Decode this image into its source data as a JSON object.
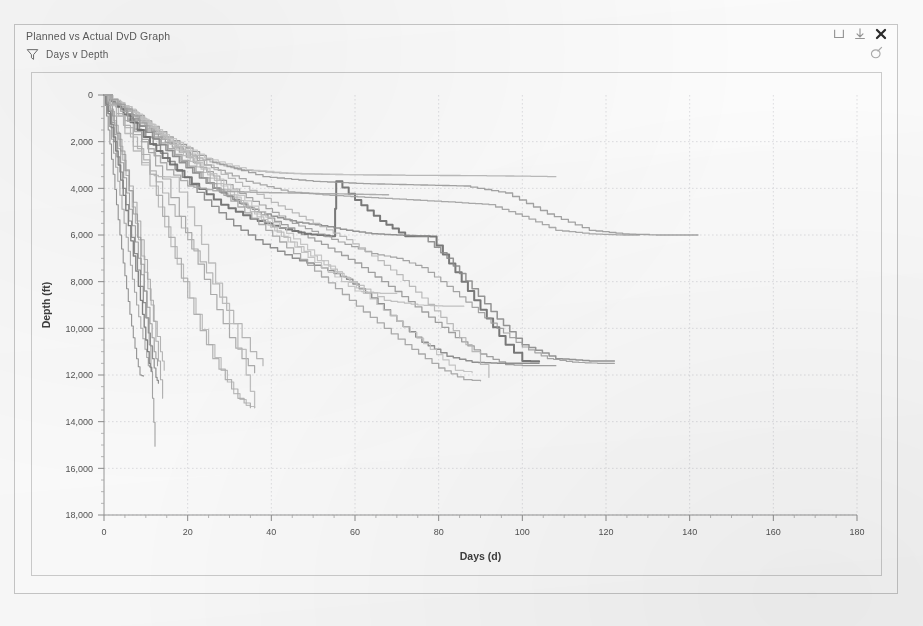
{
  "window": {
    "title": "Planned vs Actual DvD Graph",
    "subtitle": "Days v Depth",
    "funnel_icon": "filter-funnel-icon",
    "minimize_label": "minimize-icon",
    "download_label": "download-icon",
    "close_label": "close-icon",
    "edit_label": "edit-pencil-icon",
    "frame_color": "#c9c9c9"
  },
  "chart_data": {
    "type": "line",
    "title": "Planned vs Actual DvD Graph",
    "subtitle": "Days v Depth",
    "xlabel": "Days (d)",
    "ylabel": "Depth (ft)",
    "xlim": [
      0,
      180
    ],
    "ylim": [
      0,
      18000
    ],
    "y_inverted": true,
    "xticks": [
      0,
      20,
      40,
      60,
      80,
      100,
      120,
      140,
      160,
      180
    ],
    "xtick_labels": [
      "0",
      "20",
      "40",
      "60",
      "80",
      "100",
      "120",
      "140",
      "160",
      "180"
    ],
    "x_minor_step": 5,
    "yticks": [
      0,
      2000,
      4000,
      6000,
      8000,
      10000,
      12000,
      14000,
      16000,
      18000
    ],
    "ytick_labels": [
      "0",
      "2,000",
      "4,000",
      "6,000",
      "8,000",
      "10,000",
      "12,000",
      "14,000",
      "16,000",
      "18,000"
    ],
    "y_minor_step": 500,
    "grid": true,
    "grid_color": "#d9d9dd",
    "legend": "none",
    "step_style": "stepped",
    "series": [
      {
        "name": "Plan A",
        "color": "#8e8e8e",
        "width": 1.1,
        "x": [
          0,
          0.6,
          1.4,
          2.2,
          3.0,
          3.8,
          4.6,
          5.4,
          6.2,
          7.0,
          7.8,
          8.6,
          9.4
        ],
        "values": [
          0,
          900,
          2100,
          3400,
          4700,
          6000,
          7200,
          8300,
          9400,
          10400,
          11300,
          12000,
          12050
        ]
      },
      {
        "name": "Plan B",
        "color": "#a5a5a5",
        "width": 1.1,
        "x": [
          0,
          0.8,
          1.8,
          2.8,
          3.8,
          4.8,
          5.8,
          6.8,
          7.8,
          8.8,
          9.8,
          10.6,
          11.2
        ],
        "values": [
          0,
          800,
          1900,
          3100,
          4300,
          5500,
          6700,
          7900,
          9000,
          10000,
          10900,
          11600,
          11700
        ]
      },
      {
        "name": "Plan C",
        "color": "#777777",
        "width": 1.3,
        "x": [
          0,
          1.0,
          2.2,
          3.4,
          4.6,
          5.8,
          7.0,
          8.2,
          9.2,
          10.0,
          10.8,
          11.4
        ],
        "values": [
          0,
          700,
          1800,
          3000,
          4300,
          5600,
          6900,
          8200,
          9400,
          10500,
          11500,
          11850
        ]
      },
      {
        "name": "Plan D",
        "color": "#9b9b9b",
        "width": 1.1,
        "x": [
          0,
          1.2,
          2.6,
          4.0,
          5.4,
          6.8,
          8.2,
          9.6,
          11.0,
          12.0,
          12.8
        ],
        "values": [
          0,
          650,
          1700,
          2900,
          4200,
          5600,
          7000,
          8400,
          9800,
          11000,
          11600
        ]
      },
      {
        "name": "Plan E",
        "color": "#b3b3b3",
        "width": 1.1,
        "x": [
          0,
          1.5,
          3.0,
          4.5,
          6.0,
          7.5,
          9.0,
          10.5,
          12.0,
          13.5,
          14.4
        ],
        "values": [
          0,
          600,
          1600,
          2800,
          4100,
          5500,
          6900,
          8300,
          9700,
          11000,
          11800
        ]
      },
      {
        "name": "Plan F",
        "color": "#8a8a8a",
        "width": 1.2,
        "x": [
          0,
          1.0,
          2.4,
          3.8,
          5.2,
          6.6,
          8.0,
          9.4,
          10.6,
          11.6,
          12.4,
          13.0
        ],
        "values": [
          0,
          800,
          2000,
          3300,
          4700,
          6100,
          7500,
          8900,
          10200,
          11300,
          12100,
          12350
        ]
      },
      {
        "name": "Plan G steep",
        "color": "#adadad",
        "width": 1.1,
        "x": [
          0,
          1.6,
          3.4,
          5.2,
          7.0,
          8.8,
          10.4,
          11.8,
          13.0,
          14.0
        ],
        "values": [
          0,
          700,
          1900,
          3200,
          4600,
          6200,
          7900,
          9700,
          11400,
          13000
        ]
      },
      {
        "name": "Plan H deep",
        "color": "#9e9e9e",
        "width": 1.1,
        "x": [
          0,
          2.0,
          4.0,
          6.0,
          8.0,
          9.6,
          10.8,
          11.6,
          12.2
        ],
        "values": [
          0,
          900,
          2400,
          4100,
          6100,
          8400,
          10700,
          13000,
          15050
        ]
      },
      {
        "name": "Actual 1",
        "color": "#bdbdbd",
        "width": 1.2,
        "x": [
          0,
          2,
          5,
          9,
          13,
          16,
          19,
          22,
          25,
          28,
          31,
          34,
          36
        ],
        "values": [
          0,
          400,
          1400,
          3000,
          4800,
          6500,
          8000,
          9400,
          10700,
          11800,
          12800,
          13300,
          13400
        ]
      },
      {
        "name": "Actual 2",
        "color": "#b0b0b0",
        "width": 1.2,
        "x": [
          0,
          3,
          7,
          11,
          14,
          17,
          20,
          23,
          26,
          29,
          32,
          35
        ],
        "values": [
          0,
          500,
          1700,
          3400,
          5200,
          7000,
          8700,
          10100,
          11300,
          12200,
          13000,
          13400
        ]
      },
      {
        "name": "Actual 3 shallow",
        "color": "#a8a8a8",
        "width": 1.2,
        "x": [
          0,
          4,
          9,
          14,
          18,
          21,
          24,
          27,
          30,
          33,
          36
        ],
        "values": [
          0,
          600,
          1900,
          3600,
          5200,
          6600,
          7900,
          9200,
          10400,
          11300,
          11900
        ]
      },
      {
        "name": "Actual 4 long",
        "color": "#9c9c9c",
        "width": 1.3,
        "x": [
          0,
          5,
          12,
          20,
          28,
          36,
          44,
          52,
          60,
          68,
          76,
          84,
          90,
          96,
          100,
          104,
          108
        ],
        "values": [
          0,
          700,
          1900,
          3100,
          4200,
          5000,
          5700,
          6400,
          7200,
          8200,
          9300,
          10400,
          11100,
          11550,
          11600,
          11600,
          11600
        ]
      },
      {
        "name": "Actual 5 mid",
        "color": "#8b8b8b",
        "width": 1.4,
        "x": [
          0,
          4,
          10,
          17,
          24,
          31,
          38,
          45,
          52,
          58,
          64,
          70,
          76,
          82,
          88,
          94,
          100,
          104
        ],
        "values": [
          0,
          600,
          1800,
          3200,
          4500,
          5600,
          6400,
          7000,
          7400,
          7900,
          8700,
          9700,
          10600,
          11200,
          11450,
          11500,
          11500,
          11500
        ]
      },
      {
        "name": "Actual 6 sidetrack",
        "color": "#6f6f6f",
        "width": 2.0,
        "x": [
          0,
          3,
          8,
          14,
          21,
          28,
          35,
          42,
          48,
          54,
          55,
          55.5,
          60,
          66,
          72,
          78,
          84,
          90,
          96,
          100,
          104
        ],
        "values": [
          0,
          500,
          1500,
          2700,
          3800,
          4700,
          5300,
          5700,
          5950,
          6050,
          6050,
          3700,
          4500,
          5400,
          6050,
          6060,
          7600,
          9200,
          10700,
          11400,
          11420
        ]
      },
      {
        "name": "Actual 7 plateau",
        "color": "#8f8f8f",
        "width": 1.5,
        "x": [
          0,
          4,
          10,
          18,
          26,
          34,
          40,
          46,
          52,
          58,
          64,
          70,
          76,
          82,
          88,
          94,
          100,
          108,
          116,
          122
        ],
        "values": [
          0,
          550,
          1600,
          2900,
          4000,
          4800,
          5200,
          5450,
          5600,
          5800,
          5950,
          6000,
          6050,
          7000,
          8300,
          9600,
          10700,
          11300,
          11400,
          11400
        ]
      },
      {
        "name": "Actual 8 slow",
        "color": "#a6a6a6",
        "width": 1.3,
        "x": [
          0,
          6,
          14,
          24,
          34,
          44,
          54,
          64,
          74,
          84,
          92,
          100,
          108,
          116,
          124,
          128
        ],
        "values": [
          0,
          700,
          1900,
          3000,
          3700,
          4150,
          4300,
          4400,
          4500,
          4600,
          4700,
          5200,
          5800,
          5950,
          6000,
          6000
        ]
      },
      {
        "name": "Actual 9 shallow hold",
        "color": "#b8b8b8",
        "width": 1.3,
        "x": [
          0,
          5,
          12,
          22,
          32,
          42,
          52,
          62,
          72,
          82,
          90,
          96,
          100,
          104,
          108
        ],
        "values": [
          0,
          600,
          1700,
          2700,
          3200,
          3350,
          3400,
          3420,
          3440,
          3450,
          3460,
          3470,
          3480,
          3490,
          3500
        ]
      },
      {
        "name": "Actual 10 deepening",
        "color": "#9f9f9f",
        "width": 1.3,
        "x": [
          0,
          6,
          15,
          26,
          38,
          50,
          62,
          74,
          86,
          96,
          106,
          116,
          124,
          132,
          138,
          142
        ],
        "values": [
          0,
          650,
          1800,
          2900,
          3500,
          3700,
          3800,
          3850,
          3900,
          4200,
          5100,
          5800,
          5950,
          6000,
          6000,
          6000
        ]
      },
      {
        "name": "Actual 11 mid hold",
        "color": "#a2a2a2",
        "width": 1.2,
        "x": [
          0,
          5,
          13,
          23,
          34,
          45,
          56,
          64,
          70,
          76,
          82,
          88,
          94,
          100,
          106,
          112,
          118,
          122
        ],
        "values": [
          0,
          600,
          1800,
          3100,
          4400,
          5500,
          6300,
          6800,
          7000,
          7400,
          8200,
          9100,
          10000,
          10800,
          11300,
          11450,
          11500,
          11500
        ]
      },
      {
        "name": "Actual 12 upper",
        "color": "#bbbbbb",
        "width": 1.2,
        "x": [
          0,
          6,
          16,
          28,
          40,
          50,
          58,
          64,
          70,
          76,
          82,
          88,
          92
        ],
        "values": [
          0,
          700,
          2000,
          3400,
          4600,
          5500,
          6200,
          6900,
          7700,
          8700,
          9800,
          11000,
          12100
        ]
      },
      {
        "name": "Actual 13 faint upper",
        "color": "#c6c6c6",
        "width": 1.2,
        "x": [
          0,
          5,
          12,
          20,
          28,
          36,
          44,
          52,
          60,
          66,
          70
        ],
        "values": [
          0,
          500,
          1500,
          2700,
          3900,
          5100,
          6300,
          7400,
          8400,
          8500,
          8500
        ]
      },
      {
        "name": "Actual 14 faint mid",
        "color": "#c2c2c2",
        "width": 1.2,
        "x": [
          0,
          4,
          11,
          19,
          27,
          35,
          43,
          51,
          59,
          67,
          75,
          81,
          86
        ],
        "values": [
          0,
          450,
          1400,
          2600,
          3800,
          5000,
          6100,
          7100,
          8000,
          8800,
          9000,
          9050,
          9050
        ]
      },
      {
        "name": "Actual 15 faint deep",
        "color": "#c9c9c9",
        "width": 1.2,
        "x": [
          0,
          5,
          13,
          22,
          32,
          42,
          52,
          62,
          70,
          78,
          84,
          88
        ],
        "values": [
          0,
          500,
          1600,
          2900,
          4300,
          5700,
          7100,
          8500,
          9700,
          10900,
          11800,
          11900
        ]
      },
      {
        "name": "Actual 16 top shallow",
        "color": "#cccccc",
        "width": 1.2,
        "x": [
          0,
          6,
          14,
          24,
          34,
          44,
          54,
          62,
          68,
          72
        ],
        "values": [
          0,
          600,
          1700,
          2700,
          3200,
          3350,
          3400,
          3420,
          3440,
          3450
        ]
      },
      {
        "name": "Actual 17 steep early",
        "color": "#b5b5b5",
        "width": 1.2,
        "x": [
          0,
          3,
          8,
          14,
          20,
          26,
          31,
          35,
          38
        ],
        "values": [
          0,
          800,
          2300,
          4200,
          6200,
          8100,
          9800,
          11000,
          11600
        ]
      },
      {
        "name": "Actual 18 flat shoulder",
        "color": "#adadad",
        "width": 1.4,
        "x": [
          0,
          4,
          9,
          15,
          20,
          26,
          32,
          38,
          44,
          50,
          56,
          62,
          68
        ],
        "values": [
          0,
          700,
          2000,
          3200,
          3900,
          4100,
          4150,
          4180,
          4200,
          4220,
          4240,
          4260,
          4280
        ]
      },
      {
        "name": "Actual 19 early hold",
        "color": "#bfbfbf",
        "width": 1.3,
        "x": [
          0,
          3,
          7,
          11,
          13,
          16,
          20,
          25,
          30,
          34,
          36
        ],
        "values": [
          0,
          900,
          2400,
          3400,
          3500,
          3520,
          4800,
          7200,
          9800,
          12000,
          13400
        ]
      },
      {
        "name": "Actual 20 deep tail",
        "color": "#a9a9a9",
        "width": 1.3,
        "x": [
          0,
          5,
          12,
          22,
          32,
          42,
          52,
          62,
          72,
          80,
          86,
          90
        ],
        "values": [
          0,
          600,
          1800,
          3300,
          4800,
          6300,
          7800,
          9300,
          10700,
          11700,
          12200,
          12250
        ]
      }
    ]
  }
}
